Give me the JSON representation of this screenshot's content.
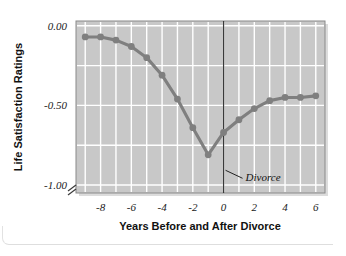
{
  "chart_data": {
    "type": "line",
    "title": "",
    "subtitle": "",
    "xlabel": "Years Before and After Divorce",
    "ylabel": "Life Satisfaction Ratings",
    "xlim": [
      -9.6,
      6.6
    ],
    "ylim": [
      -1.05,
      0.03
    ],
    "xticks": [
      -8,
      -6,
      -4,
      -2,
      0,
      2,
      4,
      6
    ],
    "xtick_labels": [
      "-8",
      "-6",
      "-4",
      "-2",
      "0",
      "2",
      "4",
      "6"
    ],
    "yticks": [
      0.0,
      -0.5,
      -1.0
    ],
    "ytick_labels": [
      "0.00",
      "-0.50",
      "-1.00"
    ],
    "grid": true,
    "grid_color": "#ffffff",
    "grid_x_step": 1,
    "grid_y_step": 0.25,
    "plot_background": "#c8c8c8",
    "axis_break": true,
    "legend": null,
    "legend_position": "none",
    "series": [
      {
        "name": "Life satisfaction",
        "color": "#7f7f7f",
        "marker": "circle",
        "x": [
          -9,
          -8,
          -7,
          -6,
          -5,
          -4,
          -3,
          -2,
          -1,
          0,
          1,
          2,
          3,
          4,
          5,
          6
        ],
        "values": [
          -0.07,
          -0.07,
          -0.09,
          -0.13,
          -0.2,
          -0.31,
          -0.46,
          -0.64,
          -0.81,
          -0.67,
          -0.59,
          -0.52,
          -0.47,
          -0.45,
          -0.45,
          -0.44
        ]
      }
    ],
    "annotations": [
      {
        "text": "Divorce",
        "x": 0,
        "y": -0.92,
        "style": "italic",
        "leader_line": true
      }
    ],
    "reference_lines": [
      {
        "orientation": "vertical",
        "x": 0,
        "color": "#3a3a3a"
      }
    ]
  }
}
